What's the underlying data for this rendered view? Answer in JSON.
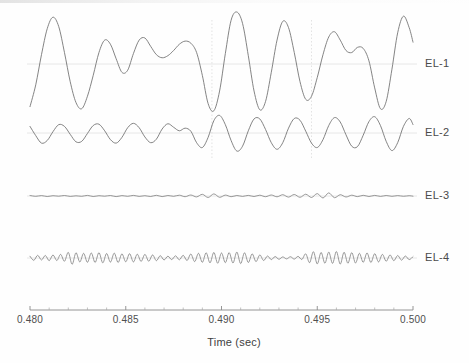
{
  "figure": {
    "background_color": "#fefefe",
    "trace_color": "#6e6e6e",
    "gridline_color": "#e2e2e2",
    "axis_color": "#8a8a8a",
    "text_color": "#4a4a4a"
  },
  "axis": {
    "title": "Time (sec)",
    "tick_labels": [
      "0.480",
      "0.485",
      "0.490",
      "0.495",
      "0.500"
    ],
    "tick_values": [
      0.48,
      0.485,
      0.49,
      0.495,
      0.5
    ],
    "minor_ticks_per_major": 5,
    "range_start": 0.48,
    "range_end": 0.5,
    "units": "sec"
  },
  "channels": [
    {
      "label": "EL-1",
      "baseline_y": 64,
      "amplitude": 52
    },
    {
      "label": "EL-2",
      "baseline_y": 133,
      "amplitude": 22
    },
    {
      "label": "EL-3",
      "baseline_y": 196,
      "amplitude": 5
    },
    {
      "label": "EL-4",
      "baseline_y": 258,
      "amplitude": 9
    }
  ],
  "chart_data": {
    "type": "line",
    "title": "",
    "subtitle": "",
    "xlabel": "Time (sec)",
    "ylabel": "",
    "xlim": [
      0.48,
      0.5
    ],
    "grid": true,
    "legend_position": "right-inline",
    "x_tick_labels": [
      "0.480",
      "0.485",
      "0.490",
      "0.495",
      "0.500"
    ],
    "x_ticks": [
      0.48,
      0.485,
      0.49,
      0.495,
      0.5
    ],
    "annotations": [],
    "series": [
      {
        "name": "EL-1",
        "description": "Large slow oscillation, amplitude grows after 0.489 sec",
        "x": [
          0.48,
          0.4803,
          0.4806,
          0.4809,
          0.4812,
          0.4815,
          0.4818,
          0.4821,
          0.4824,
          0.4827,
          0.483,
          0.4833,
          0.4836,
          0.4839,
          0.4842,
          0.4845,
          0.4848,
          0.4851,
          0.4854,
          0.4857,
          0.486,
          0.4863,
          0.4866,
          0.4869,
          0.4872,
          0.4875,
          0.4878,
          0.4881,
          0.4884,
          0.4887,
          0.489,
          0.4893,
          0.4896,
          0.4899,
          0.4902,
          0.4905,
          0.4908,
          0.4911,
          0.4914,
          0.4917,
          0.492,
          0.4923,
          0.4926,
          0.4929,
          0.4932,
          0.4935,
          0.4938,
          0.4941,
          0.4944,
          0.4947,
          0.495,
          0.4953,
          0.4956,
          0.4959,
          0.4962,
          0.4965,
          0.4968,
          0.4971,
          0.4974,
          0.4977,
          0.498,
          0.4983,
          0.4986,
          0.4989,
          0.4992,
          0.4995,
          0.4998,
          0.5
        ],
        "y": [
          -0.82,
          -0.4,
          0.18,
          0.68,
          0.9,
          0.72,
          0.22,
          -0.34,
          -0.74,
          -0.86,
          -0.62,
          -0.22,
          0.22,
          0.46,
          0.38,
          0.1,
          -0.16,
          -0.12,
          0.2,
          0.46,
          0.5,
          0.34,
          0.18,
          0.12,
          0.16,
          0.26,
          0.38,
          0.44,
          0.4,
          0.22,
          -0.22,
          -0.76,
          -0.9,
          -0.52,
          0.2,
          0.84,
          1.0,
          0.78,
          0.16,
          -0.52,
          -0.88,
          -0.72,
          -0.16,
          0.46,
          0.82,
          0.7,
          0.22,
          -0.34,
          -0.68,
          -0.62,
          -0.26,
          0.18,
          0.52,
          0.62,
          0.46,
          0.26,
          0.22,
          0.32,
          0.3,
          0.06,
          -0.46,
          -0.86,
          -0.72,
          -0.1,
          0.6,
          0.92,
          0.7,
          0.42
        ]
      },
      {
        "name": "EL-2",
        "description": "Medium-frequency oscillation, amplitude increases after 0.489 sec",
        "x": [
          0.48,
          0.4803,
          0.4806,
          0.4809,
          0.4812,
          0.4815,
          0.4818,
          0.4821,
          0.4824,
          0.4827,
          0.483,
          0.4833,
          0.4836,
          0.4839,
          0.4842,
          0.4845,
          0.4848,
          0.4851,
          0.4854,
          0.4857,
          0.486,
          0.4863,
          0.4866,
          0.4869,
          0.4872,
          0.4875,
          0.4878,
          0.4881,
          0.4884,
          0.4887,
          0.489,
          0.4893,
          0.4896,
          0.4899,
          0.4902,
          0.4905,
          0.4908,
          0.4911,
          0.4914,
          0.4917,
          0.492,
          0.4923,
          0.4926,
          0.4929,
          0.4932,
          0.4935,
          0.4938,
          0.4941,
          0.4944,
          0.4947,
          0.495,
          0.4953,
          0.4956,
          0.4959,
          0.4962,
          0.4965,
          0.4968,
          0.4971,
          0.4974,
          0.4977,
          0.498,
          0.4983,
          0.4986,
          0.4989,
          0.4992,
          0.4995,
          0.4998,
          0.5
        ],
        "y": [
          0.3,
          -0.12,
          -0.46,
          -0.34,
          0.06,
          0.38,
          0.3,
          -0.06,
          -0.4,
          -0.38,
          -0.02,
          0.34,
          0.4,
          0.1,
          -0.3,
          -0.46,
          -0.2,
          0.24,
          0.44,
          0.24,
          -0.18,
          -0.44,
          -0.28,
          0.18,
          0.42,
          0.26,
          0.1,
          0.22,
          0.08,
          -0.44,
          -0.66,
          -0.2,
          0.56,
          0.8,
          0.38,
          -0.34,
          -0.82,
          -0.6,
          0.1,
          0.64,
          0.64,
          0.16,
          -0.44,
          -0.74,
          -0.44,
          0.22,
          0.66,
          0.58,
          0.08,
          -0.46,
          -0.66,
          -0.3,
          0.34,
          0.7,
          0.5,
          -0.08,
          -0.6,
          -0.62,
          -0.1,
          0.52,
          0.74,
          0.34,
          -0.38,
          -0.8,
          -0.44,
          0.3,
          0.66,
          0.38
        ]
      },
      {
        "name": "EL-3",
        "description": "Near-flat low-amplitude trace with small ripples mid-record",
        "x": [
          0.48,
          0.4803,
          0.4806,
          0.4809,
          0.4812,
          0.4815,
          0.4818,
          0.4821,
          0.4824,
          0.4827,
          0.483,
          0.4833,
          0.4836,
          0.4839,
          0.4842,
          0.4845,
          0.4848,
          0.4851,
          0.4854,
          0.4857,
          0.486,
          0.4863,
          0.4866,
          0.4869,
          0.4872,
          0.4875,
          0.4878,
          0.4881,
          0.4884,
          0.4887,
          0.489,
          0.4893,
          0.4896,
          0.4899,
          0.4902,
          0.4905,
          0.4908,
          0.4911,
          0.4914,
          0.4917,
          0.492,
          0.4923,
          0.4926,
          0.4929,
          0.4932,
          0.4935,
          0.4938,
          0.4941,
          0.4944,
          0.4947,
          0.495,
          0.4953,
          0.4956,
          0.4959,
          0.4962,
          0.4965,
          0.4968,
          0.4971,
          0.4974,
          0.4977,
          0.498,
          0.4983,
          0.4986,
          0.4989,
          0.4992,
          0.4995,
          0.4998,
          0.5
        ],
        "y": [
          0.1,
          -0.06,
          0.08,
          -0.1,
          0.06,
          -0.04,
          0.1,
          -0.08,
          0.04,
          -0.06,
          0.12,
          -0.1,
          0.06,
          -0.04,
          0.1,
          -0.12,
          0.08,
          -0.06,
          0.12,
          -0.08,
          0.06,
          -0.1,
          0.14,
          -0.12,
          0.1,
          -0.06,
          0.16,
          -0.14,
          0.2,
          -0.18,
          0.34,
          -0.3,
          0.42,
          -0.26,
          0.18,
          -0.14,
          0.1,
          -0.08,
          0.12,
          -0.1,
          0.16,
          -0.14,
          0.2,
          -0.16,
          0.26,
          -0.22,
          0.3,
          -0.26,
          0.36,
          -0.3,
          0.48,
          -0.4,
          0.62,
          -0.34,
          0.26,
          -0.2,
          0.16,
          -0.12,
          0.14,
          -0.1,
          0.12,
          -0.08,
          0.1,
          -0.06,
          0.08,
          -0.05,
          0.06,
          -0.04
        ]
      },
      {
        "name": "EL-4",
        "description": "High-frequency low-amplitude activity with bursts",
        "x": [
          0.48,
          0.4802,
          0.4804,
          0.4806,
          0.4808,
          0.481,
          0.4812,
          0.4814,
          0.4816,
          0.4818,
          0.482,
          0.4822,
          0.4824,
          0.4826,
          0.4828,
          0.483,
          0.4832,
          0.4834,
          0.4836,
          0.4838,
          0.484,
          0.4842,
          0.4844,
          0.4846,
          0.4848,
          0.485,
          0.4852,
          0.4854,
          0.4856,
          0.4858,
          0.486,
          0.4862,
          0.4864,
          0.4866,
          0.4868,
          0.487,
          0.4872,
          0.4874,
          0.4876,
          0.4878,
          0.488,
          0.4882,
          0.4884,
          0.4886,
          0.4888,
          0.489,
          0.4892,
          0.4894,
          0.4896,
          0.4898,
          0.49,
          0.4902,
          0.4904,
          0.4906,
          0.4908,
          0.491,
          0.4912,
          0.4914,
          0.4916,
          0.4918,
          0.492,
          0.4922,
          0.4924,
          0.4926,
          0.4928,
          0.493,
          0.4932,
          0.4934,
          0.4936,
          0.4938,
          0.494,
          0.4942,
          0.4944,
          0.4946,
          0.4948,
          0.495,
          0.4952,
          0.4954,
          0.4956,
          0.4958,
          0.496,
          0.4962,
          0.4964,
          0.4966,
          0.4968,
          0.497,
          0.4972,
          0.4974,
          0.4976,
          0.4978,
          0.498,
          0.4982,
          0.4984,
          0.4986,
          0.4988,
          0.499,
          0.4992,
          0.4994,
          0.4996,
          0.4998,
          0.5
        ],
        "y": [
          0.2,
          -0.26,
          0.3,
          -0.22,
          0.28,
          -0.3,
          0.34,
          -0.28,
          0.4,
          -0.36,
          0.62,
          -0.7,
          0.58,
          -0.44,
          0.52,
          -0.48,
          0.56,
          -0.5,
          0.6,
          -0.54,
          0.5,
          -0.46,
          0.54,
          -0.5,
          0.46,
          -0.42,
          0.48,
          -0.44,
          0.42,
          -0.38,
          0.4,
          -0.36,
          0.34,
          -0.3,
          0.26,
          -0.22,
          0.2,
          -0.18,
          0.24,
          -0.2,
          0.3,
          -0.28,
          0.44,
          -0.4,
          0.52,
          -0.48,
          0.58,
          -0.54,
          0.62,
          -0.58,
          0.56,
          -0.52,
          0.6,
          -0.56,
          0.66,
          -0.62,
          0.58,
          -0.5,
          0.46,
          -0.4,
          0.34,
          -0.28,
          0.22,
          -0.18,
          0.16,
          -0.14,
          0.12,
          -0.1,
          0.14,
          -0.12,
          0.18,
          -0.16,
          0.46,
          -0.52,
          0.7,
          -0.66,
          0.62,
          -0.58,
          0.66,
          -0.6,
          0.72,
          -0.68,
          0.64,
          -0.58,
          0.6,
          -0.56,
          0.52,
          -0.48,
          0.56,
          -0.5,
          0.48,
          -0.44,
          0.4,
          -0.36,
          0.34,
          -0.3,
          0.28,
          -0.24,
          0.22,
          -0.18,
          0.16
        ]
      }
    ]
  }
}
